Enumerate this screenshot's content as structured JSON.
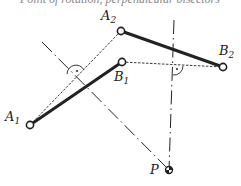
{
  "figure": {
    "top_text_fragment": "Point of rotation, perpendicular bisectors",
    "colors": {
      "line": "#222222",
      "background": "#ffffff"
    },
    "points": {
      "A1": {
        "label": "A",
        "sub": "1",
        "x": 30,
        "y": 125
      },
      "A2": {
        "label": "A",
        "sub": "2",
        "x": 121,
        "y": 31
      },
      "B1": {
        "label": "B",
        "sub": "1",
        "x": 122,
        "y": 62
      },
      "B2": {
        "label": "B",
        "sub": "2",
        "x": 223,
        "y": 67
      },
      "P": {
        "label": "P",
        "x": 169,
        "y": 170
      }
    },
    "links": [
      {
        "name": "link-A1-B1",
        "from": "A1",
        "to": "B1",
        "style": "thick"
      },
      {
        "name": "link-A2-B2",
        "from": "A2",
        "to": "B2",
        "style": "thick"
      }
    ],
    "chords": [
      {
        "name": "chord-A1-A2",
        "from": "A1",
        "to": "A2",
        "style": "dashed"
      },
      {
        "name": "chord-B1-B2",
        "from": "B1",
        "to": "B2",
        "style": "dashed"
      }
    ],
    "bisectors": [
      {
        "name": "bisector-A",
        "from": [
          42,
          42
        ],
        "to": [
          169,
          170
        ],
        "style": "dash-dot"
      },
      {
        "name": "bisector-B",
        "from": [
          174,
          20
        ],
        "to": [
          169,
          170
        ],
        "style": "dash-dot"
      }
    ],
    "right_angle_marks": [
      {
        "name": "right-angle-A",
        "x": 76,
        "y": 77
      },
      {
        "name": "right-angle-B",
        "x": 172,
        "y": 65
      }
    ]
  }
}
